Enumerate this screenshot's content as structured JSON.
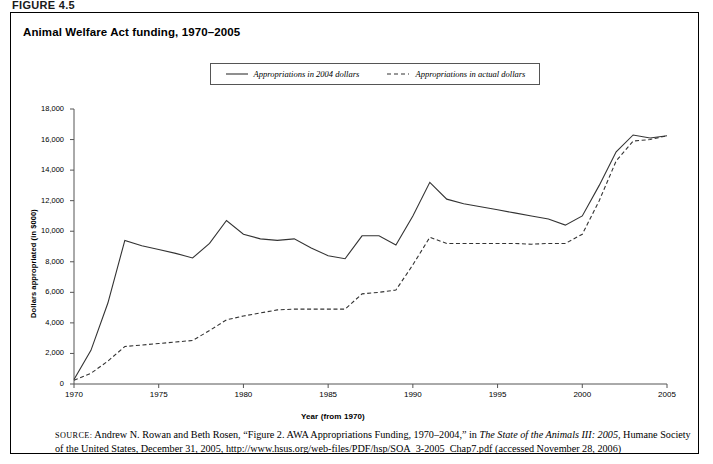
{
  "figure": {
    "label": "FIGURE 4.5",
    "title": "Animal Welfare Act funding, 1970–2005"
  },
  "legend": {
    "position": "top-center",
    "entries": [
      {
        "label": "Appropriations in 2004 dollars",
        "style": "solid",
        "color": "#333333"
      },
      {
        "label": "Appropriations in actual dollars",
        "style": "dashed",
        "color": "#333333"
      }
    ]
  },
  "axes": {
    "ylabel": "Dollars appropriated (in $000)",
    "xlabel": "Year (from 1970)",
    "yticks": [
      "0",
      "2,000",
      "4,000",
      "6,000",
      "8,000",
      "10,000",
      "12,000",
      "14,000",
      "16,000",
      "18,000"
    ],
    "xticks": [
      "1970",
      "1975",
      "1980",
      "1985",
      "1990",
      "1995",
      "2000",
      "2005"
    ]
  },
  "source": {
    "prefix": "SOURCE:",
    "text_1": " Andrew N. Rowan and Beth Rosen, “Figure 2. AWA Appropriations Funding, 1970–2004,” in ",
    "italic_1": "The State of the Animals III: 2005",
    "text_2": ", Humane Society of the United States, December 31, 2005, http://www.hsus.org/web-files/PDF/hsp/SOA_3-2005_Chap7.pdf (accessed November 28, 2006)"
  },
  "chart_data": {
    "type": "line",
    "title": "Animal Welfare Act funding, 1970–2005",
    "xlabel": "Year (from 1970)",
    "ylabel": "Dollars appropriated (in $000)",
    "xlim": [
      1970,
      2005
    ],
    "ylim": [
      0,
      18000
    ],
    "ytick_step": 2000,
    "xtick_step": 5,
    "grid": false,
    "legend_position": "top-center",
    "x": [
      1970,
      1971,
      1972,
      1973,
      1974,
      1975,
      1976,
      1977,
      1978,
      1979,
      1980,
      1981,
      1982,
      1983,
      1984,
      1985,
      1986,
      1987,
      1988,
      1989,
      1990,
      1991,
      1992,
      1993,
      1994,
      1995,
      1996,
      1997,
      1998,
      1999,
      2000,
      2001,
      2002,
      2003,
      2004,
      2005
    ],
    "series": [
      {
        "name": "Appropriations in 2004 dollars",
        "style": "solid",
        "color": "#333333",
        "values": [
          300,
          2200,
          5300,
          9400,
          9050,
          8800,
          8550,
          8250,
          9200,
          10700,
          9800,
          9500,
          9400,
          9500,
          8900,
          8400,
          8200,
          9700,
          9700,
          9100,
          11000,
          13200,
          12100,
          11800,
          11600,
          11400,
          11200,
          11000,
          10800,
          10400,
          11000,
          13000,
          15200,
          16300,
          16100,
          16250
        ]
      },
      {
        "name": "Appropriations in actual dollars",
        "style": "dashed",
        "color": "#333333",
        "values": [
          250,
          700,
          1500,
          2450,
          2550,
          2650,
          2750,
          2850,
          3500,
          4200,
          4450,
          4650,
          4850,
          4900,
          4900,
          4900,
          4900,
          5900,
          6000,
          6150,
          7800,
          9600,
          9200,
          9200,
          9200,
          9200,
          9200,
          9150,
          9200,
          9200,
          9800,
          12000,
          14600,
          15900,
          16000,
          16250
        ]
      }
    ]
  }
}
